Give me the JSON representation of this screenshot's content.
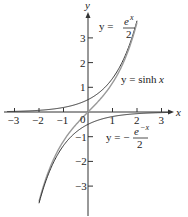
{
  "chart_data": {
    "type": "line",
    "title": "",
    "xlabel": "x",
    "ylabel": "y",
    "xlim": [
      -3.3,
      3.4
    ],
    "ylim": [
      -3.9,
      4.0
    ],
    "grid": false,
    "x_ticks": [
      -3,
      -2,
      -1,
      1,
      2,
      3
    ],
    "x_tick_labels": [
      "−3",
      "−2",
      "−1",
      "1",
      "2",
      "3"
    ],
    "y_ticks": [
      3,
      2,
      1,
      -1,
      -2,
      -3
    ],
    "y_tick_labels": [
      "3",
      "2",
      "1",
      "−1",
      "−2",
      "−3"
    ],
    "origin_label": "0",
    "series": [
      {
        "name": "y = e^x / 2",
        "function": "exp(x)/2",
        "x_range": [
          -3.3,
          2.0
        ],
        "color": "#333333"
      },
      {
        "name": "y = sinh x",
        "function": "sinh(x)",
        "x_range": [
          -2.0,
          2.0
        ],
        "color": "#999999"
      },
      {
        "name": "y = -e^(-x) / 2",
        "function": "-exp(-x)/2",
        "x_range": [
          -2.0,
          3.3
        ],
        "color": "#333333"
      }
    ],
    "annotations": [
      {
        "text": "y = e^x/2",
        "position": [
          1.3,
          3.2
        ]
      },
      {
        "text": "y = sinh x",
        "position": [
          1.5,
          1.3
        ]
      },
      {
        "text": "y = -e^(-x)/2",
        "position": [
          1.0,
          -1.2
        ]
      }
    ]
  },
  "labels": {
    "x_axis": "x",
    "y_axis": "y",
    "origin": "0",
    "eq1_lhs": "y =",
    "eq1_num": "e",
    "eq1_sup": "x",
    "eq1_den": "2",
    "eq2_lhs": "y = sinh",
    "eq2_var": "x",
    "eq3_lhs": "y = −",
    "eq3_num": "e",
    "eq3_sup": "−x",
    "eq3_den": "2"
  }
}
